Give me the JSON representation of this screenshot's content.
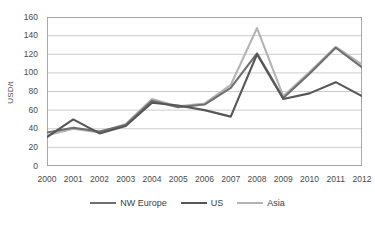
{
  "chart_data": {
    "type": "line",
    "title": "",
    "xlabel": "",
    "ylabel": "USD/t",
    "categories": [
      "2000",
      "2001",
      "2002",
      "2003",
      "2004",
      "2005",
      "2006",
      "2007",
      "2008",
      "2009",
      "2010",
      "2011",
      "2012"
    ],
    "x": [
      2000,
      2001,
      2002,
      2003,
      2004,
      2005,
      2006,
      2007,
      2008,
      2009,
      2010,
      2011,
      2012
    ],
    "ylim": [
      0,
      160
    ],
    "ytick_values": [
      0,
      20,
      40,
      60,
      80,
      100,
      120,
      140,
      160
    ],
    "ytick_labels": [
      "0",
      "20",
      "40",
      "60",
      "80",
      "100",
      "120",
      "140",
      "160"
    ],
    "grid": "horizontal",
    "legend_position": "bottom",
    "series": [
      {
        "name": "NW Europe",
        "color": "#6f6f6f",
        "values": [
          36,
          41,
          37,
          44,
          70,
          63,
          66,
          84,
          121,
          73,
          99,
          127,
          106
        ]
      },
      {
        "name": "US",
        "color": "#575757",
        "values": [
          31,
          50,
          35,
          43,
          68,
          65,
          60,
          53,
          120,
          72,
          78,
          90,
          75
        ]
      },
      {
        "name": "Asia",
        "color": "#b3b3b3",
        "values": [
          33,
          40,
          36,
          45,
          72,
          64,
          67,
          87,
          148,
          75,
          101,
          128,
          109
        ]
      }
    ]
  },
  "legend": {
    "items": [
      {
        "label": "NW Europe",
        "color": "#6f6f6f"
      },
      {
        "label": "US",
        "color": "#575757"
      },
      {
        "label": "Asia",
        "color": "#b3b3b3"
      }
    ]
  }
}
